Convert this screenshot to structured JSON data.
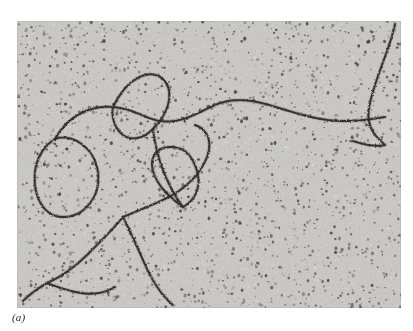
{
  "figure": {
    "label": "(a)",
    "kind": "electron-micrograph",
    "plate": {
      "x": 17,
      "y": 21,
      "width": 384,
      "height": 287,
      "background_color": "#b8b7b3",
      "filament_color": "#2b2a28",
      "page_background_color": "#ffffff"
    },
    "grain": {
      "speck_count": 2600,
      "speck_color_dark": "#3a3936",
      "speck_color_mid": "#6e6d69",
      "speck_color_light": "#d6d5d1",
      "seed": 20250413
    },
    "filaments": [
      {
        "id": "strand-upper-long",
        "description": "Long horizontal strand sweeping from the left loop across the middle to the right edge",
        "path": "M 38 118 C 50 96, 72 84, 96 86 C 118 88, 128 98, 144 100 C 164 103, 180 92, 198 84 C 214 77, 232 78, 252 84 C 276 91, 300 100, 326 100 C 344 100, 356 98, 368 96"
      },
      {
        "id": "strand-right-vertical",
        "description": "Strand running from top right edge down to the right side and hooking left",
        "path": "M 378 3 C 374 22, 366 40, 360 58 C 354 76, 350 90, 352 100 C 354 112, 362 118, 368 124 C 360 126, 348 124, 336 120"
      },
      {
        "id": "strand-left-loop",
        "description": "Large open loop on the left side of the field",
        "path": "M 38 118 C 22 128, 16 146, 18 164 C 20 182, 30 196, 46 196 C 62 196, 72 186, 78 174 C 84 160, 82 142, 72 130 C 62 118, 48 114, 38 118 Z"
      },
      {
        "id": "strand-upper-small-loop",
        "description": "Small teardrop loop in the upper left quadrant",
        "path": "M 96 86 C 104 70, 114 58, 128 54 C 140 51, 150 58, 152 70 C 154 84, 146 98, 136 108 C 126 118, 114 120, 106 114 C 98 108, 94 96, 96 86 Z"
      },
      {
        "id": "strand-mid-diagonal",
        "description": "Diagonal strand descending from the middle loop toward the lower branch point",
        "path": "M 136 108 C 138 124, 142 140, 148 154 C 154 168, 160 178, 166 186"
      },
      {
        "id": "strand-mid-right-loop",
        "description": "Broad loop in the centre of the field that closes toward the lower left",
        "path": "M 166 186 C 152 176, 140 164, 136 150 C 132 136, 140 126, 154 126 C 168 126, 176 136, 180 150 C 184 164, 180 178, 166 186 Z"
      },
      {
        "id": "strand-centre-arc",
        "description": "Arc rising from the branch point up into the centre of the field",
        "path": "M 106 196 C 120 190, 136 184, 152 176 C 170 166, 184 152, 190 136 C 196 120, 190 108, 178 104"
      },
      {
        "id": "strand-branch-descend-left",
        "description": "Strand running from the branch point down and left to the bottom edge",
        "path": "M 106 196 C 96 208, 84 220, 72 232 C 58 246, 44 256, 30 262"
      },
      {
        "id": "strand-branch-descend-right",
        "description": "Strand running from the branch point down and right toward the bottom",
        "path": "M 106 196 C 114 212, 122 230, 130 248 C 138 264, 146 276, 156 284"
      },
      {
        "id": "strand-bottom-left",
        "description": "Short strand along the bottom left corner",
        "path": "M 30 262 C 20 268, 12 274, 6 280"
      },
      {
        "id": "strand-lower-hook",
        "description": "Hooked strand at the lower left joining the bottom edge",
        "path": "M 30 262 C 40 266, 52 270, 64 272 C 76 274, 88 272, 98 266"
      }
    ]
  }
}
